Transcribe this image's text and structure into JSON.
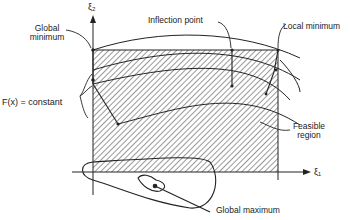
{
  "diagram": {
    "axes": {
      "x_label": "ξ₁",
      "y_label": "ξ₂"
    },
    "labels": {
      "global_minimum_line1": "Global",
      "global_minimum_line2": "minimum",
      "inflection_point": "Inflection point",
      "local_minimum": "Local minimum",
      "objective_contour": "F(x) = constant",
      "feasible_region_line1": "Feasible",
      "feasible_region_line2": "region",
      "global_maximum": "Global maximum"
    },
    "colors": {
      "ink": "#222222",
      "background": "#ffffff"
    }
  }
}
